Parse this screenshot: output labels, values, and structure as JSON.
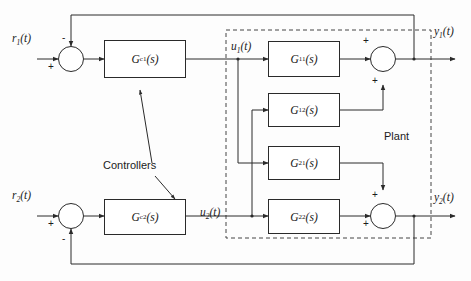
{
  "figure": {
    "line_color": "#2a2a2a",
    "dashed_color": "#444444",
    "text_color": "#1b1b1b",
    "background": "#fdfdfd"
  },
  "inputs": [
    {
      "id": "r1",
      "base": "r",
      "sub": "1",
      "arg": "(t)",
      "full": "r₁(t)"
    },
    {
      "id": "r2",
      "base": "r",
      "sub": "2",
      "arg": "(t)",
      "full": "r₂(t)"
    }
  ],
  "outputs": [
    {
      "id": "y1",
      "base": "y",
      "sub": "1",
      "arg": "(t)",
      "full": "y₁(t)"
    },
    {
      "id": "y2",
      "base": "y",
      "sub": "2",
      "arg": "(t)",
      "full": "y₂(t)"
    }
  ],
  "internal_signals": [
    {
      "id": "u1",
      "base": "u",
      "sub": "1",
      "arg": "(t)",
      "full": "u₁(t)"
    },
    {
      "id": "u2",
      "base": "u",
      "sub": "2",
      "arg": "(t)",
      "full": "u₂(t)"
    }
  ],
  "controllers": {
    "group_label": "Controllers",
    "blocks": [
      {
        "id": "Gc1",
        "base": "G",
        "sub": "c1",
        "arg": "(s)",
        "full": "G_c1(s)"
      },
      {
        "id": "Gc2",
        "base": "G",
        "sub": "c2",
        "arg": "(s)",
        "full": "G_c2(s)"
      }
    ]
  },
  "plant": {
    "group_label": "Plant",
    "blocks": [
      {
        "id": "G11",
        "base": "G",
        "sub": "11",
        "arg": "(s)",
        "full": "G11(s)"
      },
      {
        "id": "G12",
        "base": "G",
        "sub": "12",
        "arg": "(s)",
        "full": "G12(s)"
      },
      {
        "id": "G21",
        "base": "G",
        "sub": "21",
        "arg": "(s)",
        "full": "G21(s)"
      },
      {
        "id": "G22",
        "base": "G",
        "sub": "22",
        "arg": "(s)",
        "full": "G22(s)"
      }
    ]
  },
  "summing_junctions": [
    {
      "id": "sum-left-top",
      "signs": [
        {
          "which": "reference-input",
          "symbol": "+"
        },
        {
          "which": "feedback-input",
          "symbol": "-"
        }
      ]
    },
    {
      "id": "sum-left-bottom",
      "signs": [
        {
          "which": "reference-input",
          "symbol": "+"
        },
        {
          "which": "feedback-input",
          "symbol": "-"
        }
      ]
    },
    {
      "id": "sum-right-top",
      "signs": [
        {
          "which": "direct-path",
          "symbol": "+"
        },
        {
          "which": "cross-path",
          "symbol": "+"
        }
      ]
    },
    {
      "id": "sum-right-bottom",
      "signs": [
        {
          "which": "cross-path",
          "symbol": "+"
        },
        {
          "which": "direct-path",
          "symbol": "+"
        }
      ]
    }
  ]
}
